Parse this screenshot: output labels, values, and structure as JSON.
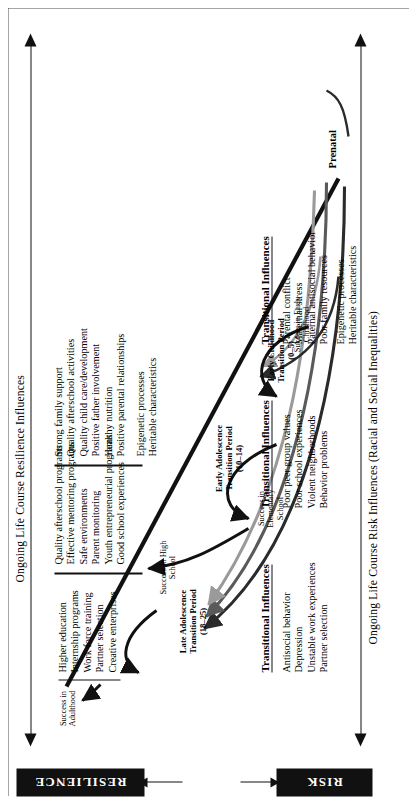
{
  "endpoints": {
    "resilience_label": "RESILIENCE",
    "risk_label": "RISK"
  },
  "axes": {
    "resilience_axis_label": "Ongoing Life Course Resilience Influences",
    "risk_axis_label": "Ongoing Life Course Risk Influences (Racial and Social Inequalities)"
  },
  "origin": {
    "label": "Prenatal"
  },
  "transition_periods": [
    {
      "name": "Early Childhood Transition Period",
      "age_range": "(0–5)"
    },
    {
      "name": "Early Adolescence Transition Period",
      "age_range": "(10–14)"
    },
    {
      "name": "Late Adolescence Transition Period",
      "age_range": "(18–25)"
    }
  ],
  "success_nodes": [
    {
      "line1": "Success in Early",
      "line2": "Childhood"
    },
    {
      "line1": "Success in",
      "line2": "Elementary",
      "line3": "School"
    },
    {
      "line1": "Success in High",
      "line2": "School"
    },
    {
      "line1": "Success in",
      "line2": "Adulthood"
    }
  ],
  "resilience_factor_groups": [
    {
      "id": "adulthood-resilience",
      "items": [
        "Higher education",
        "Internship programs",
        "Work force training",
        "Partner selection",
        "Creative enterprises"
      ]
    },
    {
      "id": "adolescence-resilience",
      "items": [
        "Quality afterschool programs",
        "Effective mentoring programs",
        "Safe environments",
        "Parent monitoring",
        "Youth entrepreneurial programs",
        "Good school experiences"
      ]
    },
    {
      "id": "childhood-resilience",
      "items": [
        "Strong family support",
        "Quality afterschool activities",
        "Quality child care/development",
        "Positive father involvement",
        "Healthy nutrition",
        "Positive parental relationships"
      ]
    }
  ],
  "resilience_baseline": {
    "items": [
      "Epigenetic processes",
      "Heritable characteristics"
    ]
  },
  "risk_factor_groups": [
    {
      "id": "adulthood-risk",
      "heading": "Transitional Influences",
      "items": [
        "Antisocial behavior",
        "Depression",
        "Unstable work experiences",
        "Partner selection"
      ]
    },
    {
      "id": "adolescence-risk",
      "heading": "Transitional Influences",
      "items": [
        "Poor peer group values",
        "Poor school experiences",
        "Violent neighborhoods",
        "Behavior problems"
      ]
    },
    {
      "id": "childhood-risk",
      "heading": "Transitional Influences",
      "items": [
        "Parental conflict",
        "Maternal stress",
        "Paternal antisocial behavior",
        "Poor family resources"
      ]
    }
  ],
  "risk_baseline": {
    "items": [
      "Epigenetic processes",
      "Heritable characteristics"
    ]
  },
  "colors": {
    "ink": "#111111",
    "box_fill": "#111111",
    "box_text": "#ffffff",
    "curve_dark": "#2b2b2b",
    "curve_mid": "#5a5a5a",
    "curve_light": "#9a9a9a"
  }
}
